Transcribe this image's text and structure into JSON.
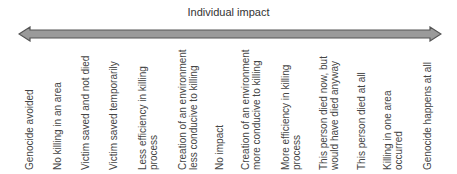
{
  "title": "Individual impact",
  "arrow": {
    "fill": "#9a9a9a",
    "stroke": "#555555"
  },
  "labels": [
    {
      "line1": "Genocide avoided",
      "line2": ""
    },
    {
      "line1": "No killing in an area",
      "line2": ""
    },
    {
      "line1": "Victim saved and not died",
      "line2": ""
    },
    {
      "line1": "Victim saved temporarily",
      "line2": ""
    },
    {
      "line1": "Less efficiency in killing",
      "line2": "process"
    },
    {
      "line1": "Creation of an environment",
      "line2": "less conducive to killing"
    },
    {
      "line1": "No impact",
      "line2": ""
    },
    {
      "line1": "Creation of an environment",
      "line2": "more conducive to killing"
    },
    {
      "line1": "More efficiency in killing",
      "line2": "process"
    },
    {
      "line1": "This person died now, but",
      "line2": "would have died anyway"
    },
    {
      "line1": "This person died at all",
      "line2": ""
    },
    {
      "line1": "Killing in one area",
      "line2": "occurred"
    },
    {
      "line1": "Genocide happens at all",
      "line2": ""
    }
  ]
}
